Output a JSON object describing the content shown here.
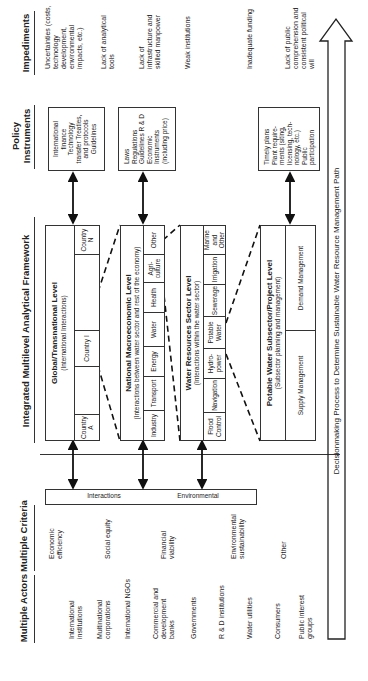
{
  "headers": {
    "actors": "Multiple Actors",
    "criteria": "Multiple Criteria",
    "framework": "Integrated Multilevel Analytical Framework",
    "policy": "Policy Instruments",
    "impediments": "Impediments"
  },
  "actors": [
    "International institutions",
    "Multinational corporations",
    "International NGOs",
    "Commercial and development banks",
    "Governments",
    "R & D institutions",
    "Water utilities",
    "Consumers",
    "Public interest groups"
  ],
  "criteria": [
    "Economic efficiency",
    "Social equity",
    "Financial viability",
    "Environmental sustainability",
    "Other"
  ],
  "side_bar": {
    "left": "Interactions",
    "right": "Environmental"
  },
  "levels": {
    "global": {
      "title": "Global/Transnational Level",
      "subtitle": "(International Interactions)",
      "cells": [
        "Country A",
        "",
        "Country I",
        "",
        "Country N"
      ]
    },
    "national": {
      "title": "National Macroeconomic Level",
      "subtitle": "(Interactions between water sector and rest of the economy)",
      "cells": [
        "Industry",
        "Transport",
        "Energy",
        "Water",
        "Health",
        "Agri-culture",
        "Other"
      ]
    },
    "water": {
      "title": "Water Resources Sector Level",
      "subtitle": "(Interactions within the water sector)",
      "cells": [
        "Flood Control",
        "Navigation",
        "Hydro-power",
        "Potable Water",
        "Sewerage",
        "Irrigation",
        "Marine and Other"
      ]
    },
    "potable": {
      "title": "Potable Water Subsector/Project Level",
      "subtitle": "(Subsector planning and management)",
      "cells": [
        "Supply Management",
        "Demand Management"
      ]
    }
  },
  "policy": [
    "International finance Technology transfer Treaties, and protocols Guidelines",
    "Laws Regulations Guidelines R & D Economic Instruments (including price)",
    "Timely plans Plant require-ments (siting, licensing, tech-nology, etc.) Public participation"
  ],
  "impediments": [
    "Uncertainties (costs, technology development, environmental impacts, etc.)",
    "Lack of analytical tools",
    "Lack of infrastructure and skilled manpower",
    "Weak institutions",
    "Inadequate funding",
    "Lack of public comprehension and consistent political will"
  ],
  "bottom_arrow": {
    "label": "Decisionmaking Process to Determine Sustainable Water Resource Management Path"
  }
}
